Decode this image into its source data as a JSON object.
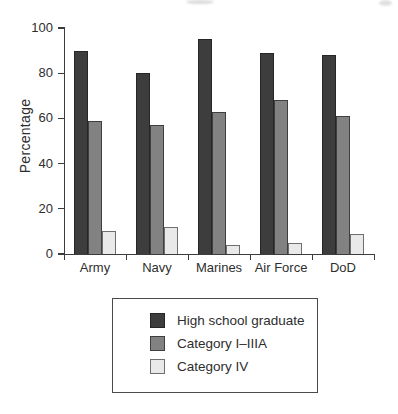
{
  "chart_data": {
    "type": "bar",
    "title": "",
    "categories": [
      "Army",
      "Navy",
      "Marines",
      "Air Force",
      "DoD"
    ],
    "series": [
      {
        "name": "High school graduate",
        "values": [
          90,
          80,
          95,
          89,
          88
        ],
        "fill": "#3d3d3d",
        "border": "#262626"
      },
      {
        "name": "Category I–IIIA",
        "values": [
          59,
          57,
          63,
          68,
          61
        ],
        "fill": "#828282",
        "border": "#3f3f3f"
      },
      {
        "name": "Category IV",
        "values": [
          10,
          12,
          4,
          5,
          9
        ],
        "fill": "#e9e9e9",
        "border": "#6f6f6f"
      }
    ],
    "xlabel": "",
    "ylabel": "Percentage",
    "ylim": [
      0,
      100
    ],
    "yticks": [
      0,
      20,
      40,
      60,
      80,
      100
    ],
    "grid": false,
    "legend_position": "bottom-center-box",
    "axis_color": "#3c3c3c"
  }
}
